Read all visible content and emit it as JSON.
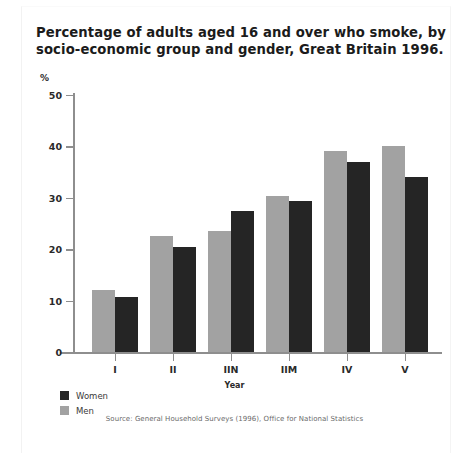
{
  "chart_data": {
    "type": "bar",
    "title": "Percentage of adults aged 16 and over who smoke, by socio-economic group and gender, Great Britain 1996.",
    "title_lines": [
      "Percentage of adults aged 16 and over who smoke, by",
      "socio-economic group and gender, Great Britain 1996."
    ],
    "unit_label": "%",
    "xlabel": "Year",
    "ylabel": "",
    "categories": [
      "I",
      "II",
      "IIN",
      "IIM",
      "IV",
      "V"
    ],
    "series": [
      {
        "name": "Men",
        "color": "#a2a2a2",
        "values": [
          12.0,
          22.5,
          23.5,
          30.3,
          39.2,
          40.0
        ]
      },
      {
        "name": "Women",
        "color": "#252525",
        "values": [
          10.8,
          20.5,
          27.5,
          29.3,
          37.0,
          34.0
        ]
      }
    ],
    "ylim": [
      0,
      50
    ],
    "yticks": [
      0,
      10,
      20,
      30,
      40,
      50
    ],
    "ytick_labels": [
      "0",
      "10",
      "20",
      "30",
      "40",
      "50"
    ],
    "grid": false,
    "legend_position": "bottom-left",
    "legend": [
      {
        "label": "Women",
        "color": "#252525"
      },
      {
        "label": "Men",
        "color": "#a2a2a2"
      }
    ],
    "source": "Source: General Household Surveys (1996), Office for National Statistics"
  }
}
